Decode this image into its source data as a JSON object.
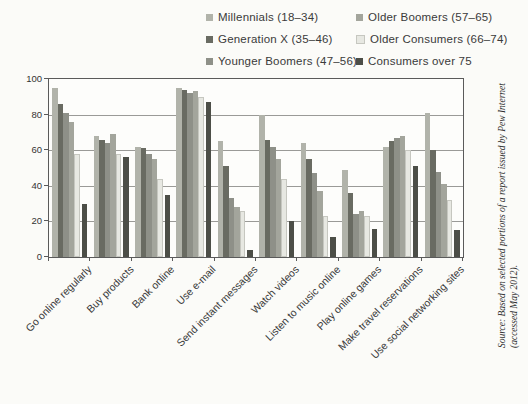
{
  "chart_data": {
    "type": "bar",
    "title": "",
    "xlabel": "",
    "ylabel": "",
    "ylim": [
      0,
      100
    ],
    "yticks": [
      0,
      20,
      40,
      60,
      80,
      100
    ],
    "grid": true,
    "legend_position": "top",
    "categories": [
      "Go online regularly",
      "Buy products",
      "Bank online",
      "Use e-mail",
      "Send instant messages",
      "Watch videos",
      "Listen to music online",
      "Play online games",
      "Make travel reservations",
      "Use social networking sites"
    ],
    "series": [
      {
        "name": "Millennials (18–34)",
        "color": "#b1b3aa",
        "values": [
          95,
          68,
          62,
          95,
          65,
          80,
          64,
          49,
          62,
          81
        ]
      },
      {
        "name": "Generation X (35–46)",
        "color": "#696b62",
        "values": [
          86,
          66,
          61,
          94,
          51,
          66,
          55,
          36,
          65,
          60
        ]
      },
      {
        "name": "Younger Boomers (47–56)",
        "color": "#8e9088",
        "values": [
          81,
          64,
          58,
          92,
          33,
          62,
          47,
          24,
          67,
          48
        ]
      },
      {
        "name": "Older Boomers (57–65)",
        "color": "#a3a59c",
        "values": [
          76,
          69,
          55,
          93,
          28,
          55,
          37,
          26,
          68,
          41
        ]
      },
      {
        "name": "Older Consumers (66–74)",
        "color": "#e7e8e2",
        "values": [
          58,
          58,
          44,
          90,
          26,
          44,
          23,
          23,
          60,
          32
        ]
      },
      {
        "name": "Consumers over 75",
        "color": "#4c4e47",
        "values": [
          30,
          56,
          35,
          87,
          4,
          20,
          11,
          16,
          51,
          15
        ]
      }
    ]
  },
  "source": {
    "line1": "Source: Based on selected portions of a report issued by Pew Internet",
    "line2": "(accessed May 2012)."
  }
}
